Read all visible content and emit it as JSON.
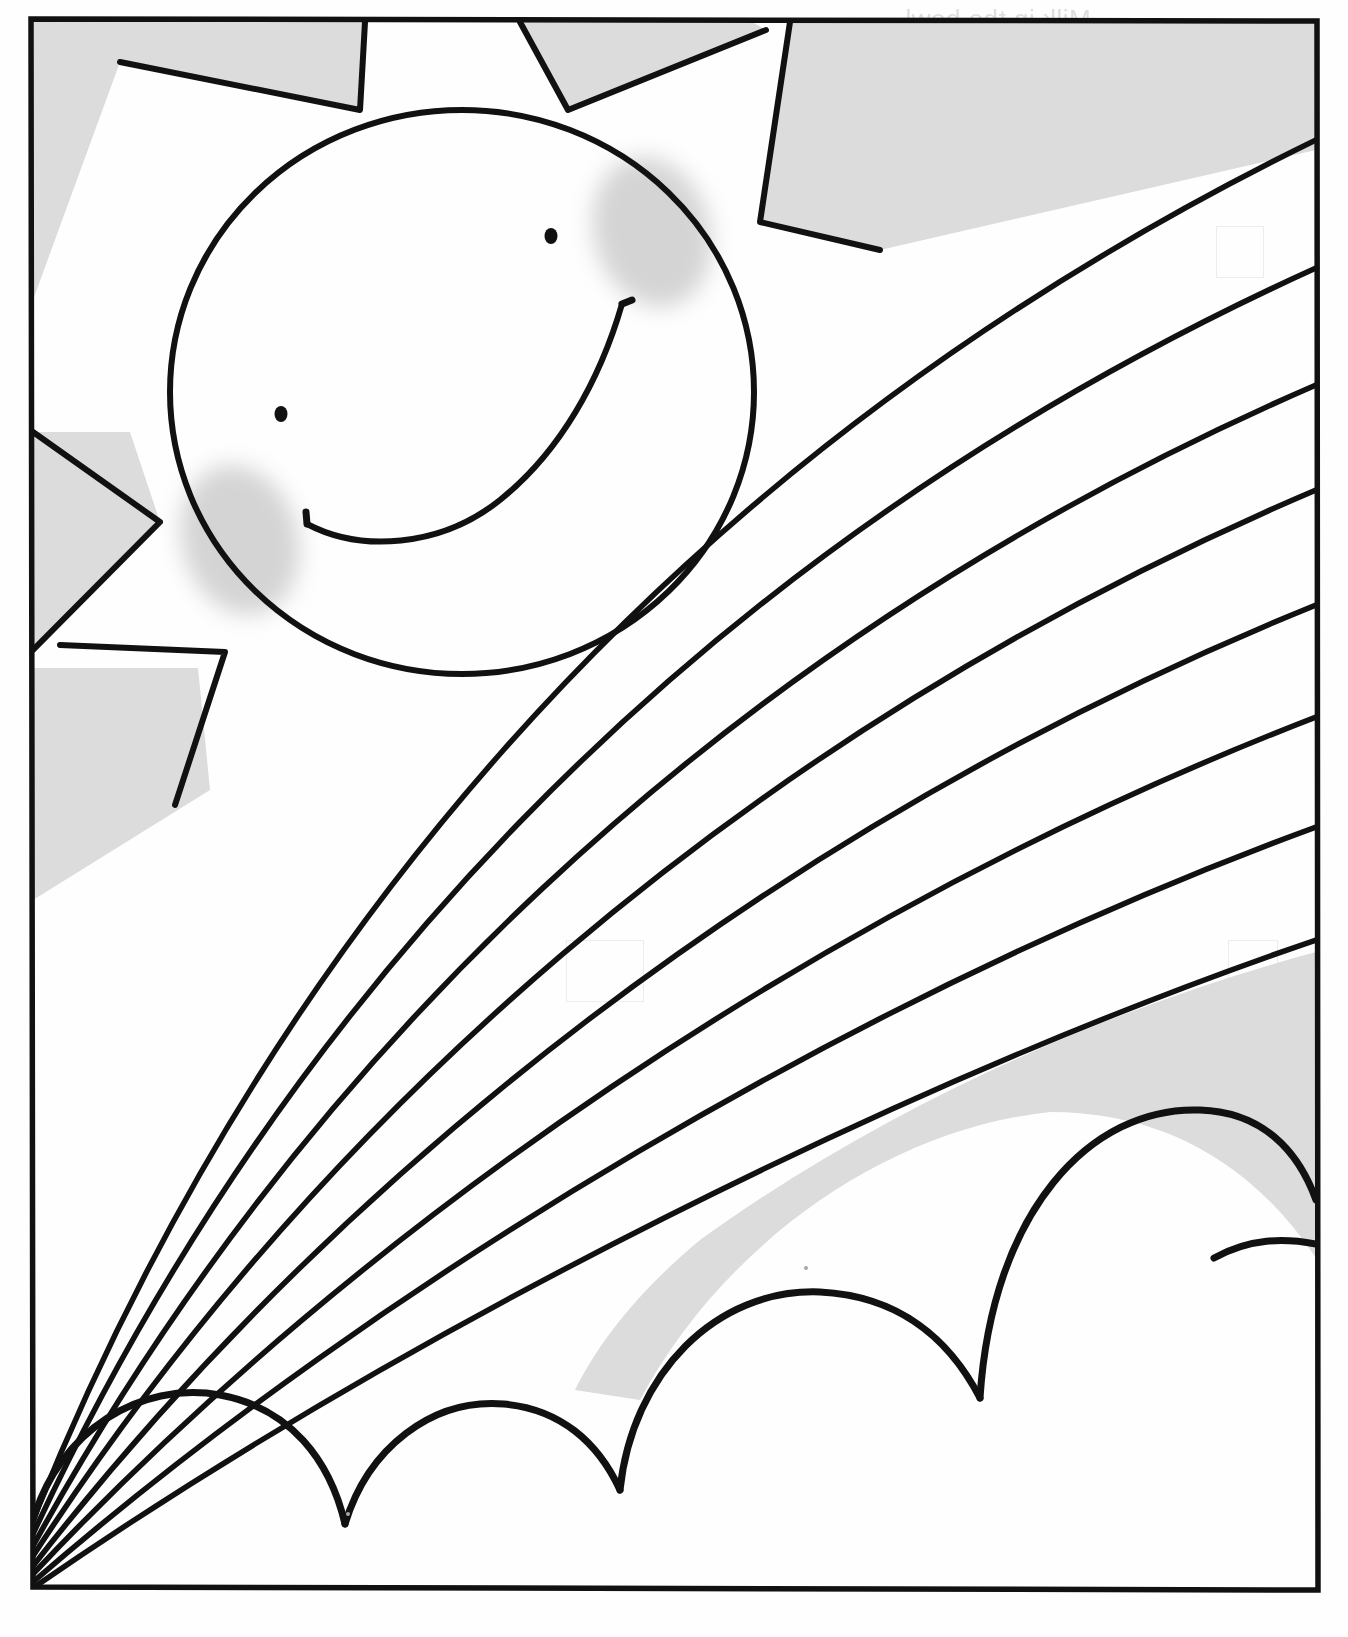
{
  "page": {
    "kind": "coloring-book-worksheet",
    "width": 1348,
    "height": 1637,
    "paper_color": "#fefefe",
    "ink_color": "#111111",
    "shade_color": "#d9d9d9",
    "blush_color": "#d2d2d2",
    "frame": {
      "left": 30,
      "top": 18,
      "right": 1318,
      "bottom": 1590,
      "stroke_width": 5
    }
  },
  "sun": {
    "label": "smiling-sun",
    "face": {
      "cx": 462,
      "cy": 392,
      "rx": 292,
      "ry": 282
    },
    "eyes": [
      {
        "label": "left-eye",
        "cx": 281,
        "cy": 414,
        "r": 6
      },
      {
        "label": "right-eye",
        "cx": 551,
        "cy": 236,
        "r": 6
      }
    ],
    "blush": [
      {
        "label": "left-cheek",
        "cx": 240,
        "cy": 540,
        "rx": 62,
        "ry": 78,
        "rotate": -18
      },
      {
        "label": "right-cheek",
        "cx": 650,
        "cy": 232,
        "rx": 62,
        "ry": 78,
        "rotate": -18
      }
    ],
    "mouth_label": "smile",
    "rays": [
      {
        "label": "ray-top-left"
      },
      {
        "label": "ray-top-center"
      },
      {
        "label": "ray-top-right"
      },
      {
        "label": "ray-left-upper"
      },
      {
        "label": "ray-left-lower"
      },
      {
        "label": "ray-bottom-left"
      }
    ],
    "ray_count": 6
  },
  "rainbow": {
    "label": "rainbow-arc",
    "band_count": 7,
    "separator_line_count": 8,
    "origin": {
      "x": 33,
      "y": 1520
    },
    "right_edge_crossings_y": [
      158,
      268,
      385,
      490,
      605,
      717,
      827,
      940
    ],
    "note": "Concentric arcs sweeping from the lower-left corner up to the right edge of the frame."
  },
  "clouds": {
    "label": "cloud-bumps",
    "bump_count": 4,
    "bumps": [
      {
        "label": "cloud-bump-1",
        "cx": 170,
        "cy": 1508,
        "r": 145
      },
      {
        "label": "cloud-bump-2",
        "cx": 430,
        "cy": 1470,
        "r": 130
      },
      {
        "label": "cloud-bump-3",
        "cx": 660,
        "cy": 1380,
        "r": 175
      },
      {
        "label": "cloud-bump-4",
        "cx": 1050,
        "cy": 1240,
        "r": 218
      }
    ]
  },
  "sky_shading": {
    "label": "shaded-sky-region",
    "color": "#d9d9d9",
    "note": "Light gray tone filling the sky between the sun rays, below the last rainbow band and above the clouds."
  },
  "show_through": {
    "label": "reverse-side-bleed-through",
    "description": "Faint mirror-reversed text printed on the back of the sheet, visible through the paper.",
    "mirrored": true,
    "lines": [
      {
        "text": "Milk in the bowl",
        "x": 905,
        "y": 4,
        "size": 26
      },
      {
        "text": "After three colors are added",
        "x": 845,
        "y": 36,
        "size": 26
      },
      {
        "text": "After soap is added",
        "x": 880,
        "y": 72,
        "size": 26
      },
      {
        "text": "After all of the colors have mixed",
        "x": 820,
        "y": 108,
        "size": 26
      }
    ],
    "marks": [
      {
        "label": "bleed-mark-bullet-1",
        "x": 818,
        "y": 40,
        "w": 10,
        "h": 10
      },
      {
        "label": "bleed-mark-bullet-2",
        "x": 818,
        "y": 76,
        "w": 10,
        "h": 10
      },
      {
        "label": "bleed-mark-bullet-3",
        "x": 812,
        "y": 112,
        "w": 10,
        "h": 10
      }
    ],
    "boxes": [
      {
        "label": "bleed-box-top-right",
        "x": 1216,
        "y": 226,
        "w": 46,
        "h": 50
      },
      {
        "label": "bleed-box-mid-right",
        "x": 1228,
        "y": 940,
        "w": 48,
        "h": 48
      },
      {
        "label": "bleed-box-mid-left",
        "x": 566,
        "y": 940,
        "w": 76,
        "h": 60
      }
    ]
  }
}
